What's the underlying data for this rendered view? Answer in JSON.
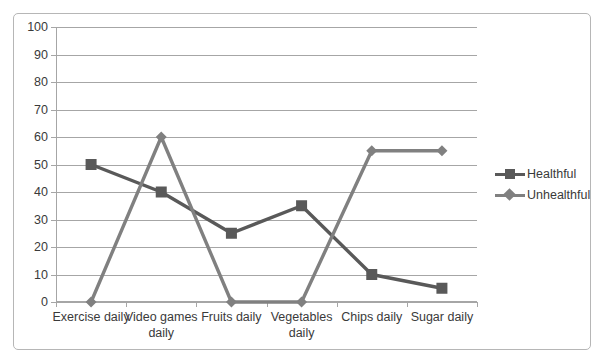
{
  "chart_data": {
    "type": "line",
    "title": "",
    "xlabel": "",
    "ylabel": "",
    "ylim": [
      0,
      100
    ],
    "y_ticks": [
      0,
      10,
      20,
      30,
      40,
      50,
      60,
      70,
      80,
      90,
      100
    ],
    "grid": true,
    "legend_position": "right",
    "categories": [
      "Exercise daily",
      "Video games daily",
      "Fruits daily",
      "Vegetables daily",
      "Chips daily",
      "Sugar daily"
    ],
    "series": [
      {
        "name": "Healthful",
        "marker": "square",
        "color": "#595959",
        "values": [
          50,
          40,
          25,
          35,
          10,
          5
        ]
      },
      {
        "name": "Unhealthful",
        "marker": "diamond",
        "color": "#808080",
        "values": [
          0,
          60,
          0,
          0,
          55,
          55
        ]
      }
    ]
  },
  "legend": {
    "items": [
      {
        "label": "Healthful"
      },
      {
        "label": "Unhealthful"
      }
    ]
  },
  "colors": {
    "healthful": "#595959",
    "unhealthful": "#808080",
    "grid": "#a6a6a6",
    "border": "#b6b6b6",
    "text": "#3a3a3a",
    "background": "#ffffff"
  }
}
